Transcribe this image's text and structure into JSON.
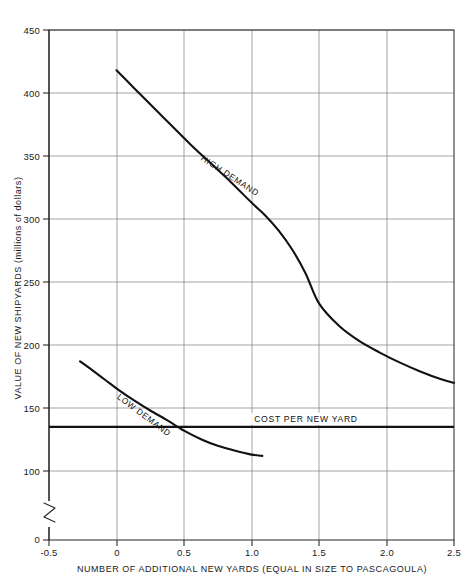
{
  "chart_data": {
    "type": "line",
    "title": "",
    "xlabel": "NUMBER OF ADDITIONAL NEW YARDS  (EQUAL IN SIZE TO PASCAGOULA)",
    "ylabel": "VALUE OF NEW SHIPYARDS (millions of dollars)",
    "xlim": [
      -0.5,
      2.5
    ],
    "ylim": [
      85,
      460
    ],
    "grid": true,
    "legend_position": "inline-along-curves",
    "y_axis_break": true,
    "y_axis_break_label": "0",
    "xticks": [
      -0.5,
      0,
      0.5,
      1.0,
      1.5,
      2.0,
      2.5
    ],
    "xtick_labels": [
      "-0.5",
      "0",
      "0.5",
      "1.0",
      "1.5",
      "2.0",
      "2.5"
    ],
    "yticks": [
      100,
      150,
      200,
      250,
      300,
      350,
      400,
      450
    ],
    "ytick_labels": [
      "100",
      "150",
      "200",
      "250",
      "300",
      "350",
      "400",
      "450"
    ],
    "y_origin_label": "0",
    "series": [
      {
        "name": "HIGH DEMAND",
        "label": "HIGH DEMAND",
        "label_x": 0.62,
        "label_y": 347,
        "label_rotation": 33,
        "x": [
          0.0,
          0.12,
          0.25,
          0.4,
          0.55,
          0.7,
          0.85,
          1.0,
          1.1,
          1.2,
          1.3,
          1.4,
          1.5,
          1.65,
          1.8,
          1.95,
          2.1,
          2.25,
          2.4,
          2.5
        ],
        "y": [
          418,
          405,
          391,
          375,
          359,
          344,
          329,
          313,
          303,
          291,
          276,
          257,
          233,
          215,
          203,
          194,
          186,
          179,
          173,
          170
        ]
      },
      {
        "name": "LOW DEMAND",
        "label": "LOW DEMAND",
        "label_x": 0.0,
        "label_y": 158,
        "label_rotation": 37,
        "x": [
          -0.27,
          -0.18,
          -0.08,
          0.02,
          0.13,
          0.25,
          0.38,
          0.5,
          0.63,
          0.75,
          0.88,
          1.0,
          1.08
        ],
        "y": [
          187,
          180,
          172,
          164,
          156,
          148,
          140,
          132,
          125,
          120,
          116,
          113,
          112
        ]
      }
    ],
    "reference_lines": [
      {
        "name": "COST PER NEW YARD",
        "label": "COST PER NEW YARD",
        "label_x": 1.02,
        "orientation": "horizontal",
        "value": 135,
        "x_start": -0.5,
        "x_end": 2.5,
        "color": "#111111"
      }
    ]
  }
}
